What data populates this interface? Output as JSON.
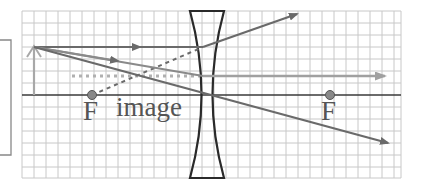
{
  "diagram": {
    "type": "ray-diagram-diverging-lens",
    "labels": {
      "focal_left": "F",
      "image": "image",
      "focal_right": "F"
    },
    "colors": {
      "grid": "#c8c8c8",
      "axis": "#3a3a3a",
      "lens": "#2a2a2a",
      "ray": "#6a6a6a",
      "ray_light": "#9a9a9a",
      "object": "#999999",
      "focal_point": "#777777",
      "side_box": "#888888"
    }
  }
}
